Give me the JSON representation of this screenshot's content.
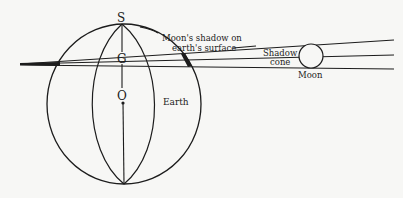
{
  "diagram": {
    "labels": {
      "S": "S",
      "G": "G",
      "O": "O",
      "earth": "Earth",
      "moon": "Moon",
      "shadow_on_surface_line1": "Moon's shadow on",
      "shadow_on_surface_line2": "earth's surface",
      "shadow_cone_line1": "Shadow",
      "shadow_cone_line2": "cone"
    },
    "colors": {
      "ink": "#1c1c1c",
      "paper": "#f7f7f5"
    }
  }
}
